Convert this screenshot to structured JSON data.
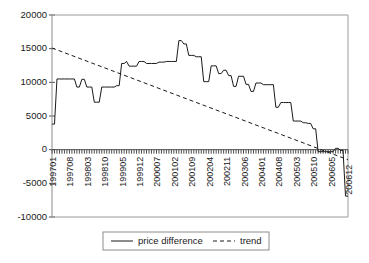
{
  "chart_data": {
    "type": "line",
    "title": "",
    "xlabel": "",
    "ylabel": "",
    "ylim": [
      -10000,
      20000
    ],
    "grid": false,
    "legend_position": "bottom",
    "ytick_labels": [
      "20000",
      "15000",
      "10000",
      "5000",
      "0",
      "-5000",
      "-10000"
    ],
    "ytick_values": [
      20000,
      15000,
      10000,
      5000,
      0,
      -5000,
      -10000
    ],
    "xtick_labels": [
      "199701",
      "199708",
      "199803",
      "199810",
      "199905",
      "199912",
      "200007",
      "200102",
      "200109",
      "200204",
      "200211",
      "200306",
      "200401",
      "200408",
      "200503",
      "200510",
      "200605",
      "200612"
    ],
    "xtick_indices": [
      0,
      7,
      14,
      21,
      28,
      35,
      42,
      49,
      56,
      63,
      70,
      77,
      84,
      91,
      98,
      105,
      112,
      119
    ],
    "x_count": 120,
    "series": [
      {
        "name": "price difference",
        "style": "solid",
        "color": "#1a1a1a",
        "values": [
          3800,
          3800,
          10500,
          10500,
          10500,
          10500,
          10500,
          10500,
          10500,
          10500,
          9300,
          9300,
          10450,
          10450,
          9300,
          9300,
          9300,
          7050,
          7050,
          7050,
          9300,
          9300,
          9300,
          9300,
          9300,
          9300,
          9500,
          9500,
          12800,
          12800,
          13100,
          12400,
          12400,
          12400,
          12400,
          13100,
          13100,
          13100,
          12800,
          12800,
          12800,
          12800,
          12800,
          13000,
          13000,
          13000,
          13100,
          13100,
          13100,
          13100,
          13100,
          16200,
          16200,
          15700,
          15700,
          14000,
          14000,
          14000,
          13800,
          13800,
          13800,
          10100,
          10100,
          10100,
          12450,
          12450,
          12450,
          11300,
          11300,
          11800,
          11800,
          11000,
          11000,
          9400,
          9400,
          10900,
          10900,
          10900,
          9700,
          9700,
          8650,
          8650,
          9900,
          9900,
          9900,
          9650,
          9650,
          9650,
          9650,
          9650,
          6300,
          6300,
          7000,
          7000,
          7000,
          7000,
          7000,
          4250,
          4250,
          4250,
          4250,
          4000,
          4000,
          3900,
          3900,
          3100,
          3100,
          -300,
          -300,
          -300,
          -300,
          -300,
          -300,
          -300,
          200,
          200,
          -100,
          -100,
          -6900,
          -6900
        ]
      },
      {
        "name": "trend",
        "style": "dashed",
        "color": "#1a1a1a",
        "values": [
          15100,
          -1500
        ],
        "endpoints_x": [
          0,
          119
        ]
      }
    ],
    "legend": [
      {
        "label": "price difference",
        "style": "solid"
      },
      {
        "label": "trend",
        "style": "dashed"
      }
    ]
  },
  "legend": {
    "price_difference_label": "price difference",
    "trend_label": "trend"
  }
}
